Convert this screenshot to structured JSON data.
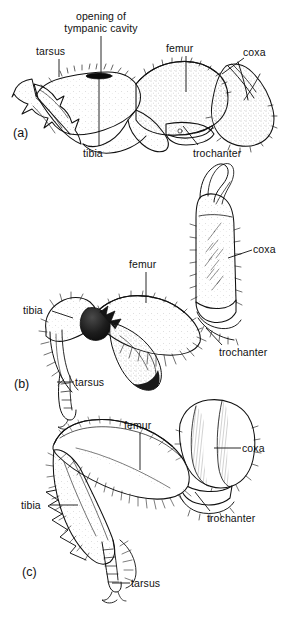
{
  "figure": {
    "type": "scientific-line-drawing",
    "background_color": "#ffffff",
    "ink_color": "#111111",
    "panel_count": 3
  },
  "panels": [
    {
      "id": "a",
      "letter": "(a)",
      "letter_pos": {
        "x": 13,
        "y": 126
      },
      "labels": [
        {
          "name": "opening-of-tympanic-cavity",
          "text": "opening of\ntympanic cavity",
          "x": 58,
          "y": 10,
          "w": 86,
          "align": "center",
          "leader": {
            "x1": 101,
            "y1": 36,
            "x2": 101,
            "y2": 74
          }
        },
        {
          "name": "tarsus",
          "text": "tarsus",
          "x": 36,
          "y": 45,
          "w": 40,
          "align": "left",
          "leader": {
            "x1": 59,
            "y1": 59,
            "x2": 59,
            "y2": 77
          }
        },
        {
          "name": "femur",
          "text": "femur",
          "x": 166,
          "y": 42,
          "w": 40,
          "align": "left",
          "leader": {
            "x1": 186,
            "y1": 56,
            "x2": 186,
            "y2": 92
          }
        },
        {
          "name": "coxa",
          "text": "coxa",
          "x": 243,
          "y": 46,
          "w": 32,
          "align": "left",
          "leader": {
            "x1": 244,
            "y1": 58,
            "x2": 222,
            "y2": 74
          }
        },
        {
          "name": "tibia",
          "text": "tibia",
          "x": 83,
          "y": 147,
          "w": 32,
          "align": "left",
          "leader": {
            "x1": 99,
            "y1": 146,
            "x2": 99,
            "y2": 78
          }
        },
        {
          "name": "trochanter",
          "text": "trochanter",
          "x": 193,
          "y": 147,
          "w": 58,
          "align": "left",
          "leader": {
            "x1": 198,
            "y1": 145,
            "x2": 183,
            "y2": 126
          }
        }
      ]
    },
    {
      "id": "b",
      "letter": "(b)",
      "letter_pos": {
        "x": 14,
        "y": 377
      },
      "labels": [
        {
          "name": "coxa",
          "text": "coxa",
          "x": 253,
          "y": 243,
          "w": 32,
          "align": "left",
          "leader": {
            "x1": 252,
            "y1": 250,
            "x2": 228,
            "y2": 258
          }
        },
        {
          "name": "femur",
          "text": "femur",
          "x": 129,
          "y": 258,
          "w": 40,
          "align": "left",
          "leader": {
            "x1": 146,
            "y1": 272,
            "x2": 146,
            "y2": 303
          }
        },
        {
          "name": "tibia",
          "text": "tibia",
          "x": 23,
          "y": 304,
          "w": 28,
          "align": "left",
          "leader": {
            "x1": 52,
            "y1": 311,
            "x2": 73,
            "y2": 318
          }
        },
        {
          "name": "trochanter",
          "text": "trochanter",
          "x": 219,
          "y": 346,
          "w": 58,
          "align": "left",
          "leader": {
            "x1": 222,
            "y1": 345,
            "x2": 206,
            "y2": 328
          }
        },
        {
          "name": "tarsus",
          "text": "tarsus",
          "x": 75,
          "y": 376,
          "w": 40,
          "align": "left",
          "leader": {
            "x1": 74,
            "y1": 382,
            "x2": 57,
            "y2": 382
          }
        }
      ]
    },
    {
      "id": "c",
      "letter": "(c)",
      "letter_pos": {
        "x": 22,
        "y": 565
      },
      "labels": [
        {
          "name": "femur",
          "text": "femur",
          "x": 124,
          "y": 419,
          "w": 40,
          "align": "left",
          "leader": {
            "x1": 140,
            "y1": 433,
            "x2": 140,
            "y2": 470
          }
        },
        {
          "name": "coxa",
          "text": "coxa",
          "x": 242,
          "y": 442,
          "w": 32,
          "align": "left",
          "leader": {
            "x1": 241,
            "y1": 448,
            "x2": 214,
            "y2": 448
          }
        },
        {
          "name": "tibia",
          "text": "tibia",
          "x": 21,
          "y": 499,
          "w": 28,
          "align": "left",
          "leader": {
            "x1": 50,
            "y1": 505,
            "x2": 78,
            "y2": 505
          }
        },
        {
          "name": "trochanter",
          "text": "trochanter",
          "x": 207,
          "y": 512,
          "w": 58,
          "align": "left",
          "leader": {
            "x1": 210,
            "y1": 511,
            "x2": 195,
            "y2": 492
          }
        },
        {
          "name": "tarsus",
          "text": "tarsus",
          "x": 131,
          "y": 577,
          "w": 40,
          "align": "left",
          "leader": {
            "x1": 130,
            "y1": 583,
            "x2": 112,
            "y2": 583
          }
        }
      ]
    }
  ]
}
